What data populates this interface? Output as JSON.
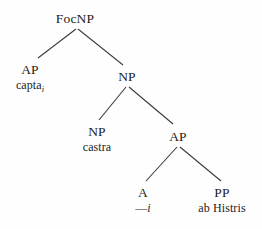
{
  "figure": {
    "type": "syntax-tree",
    "background_color": "#fefefe",
    "line_color": "#3a3a3a",
    "text_color": "#1c1c1c"
  },
  "nodes": [
    {
      "id": "root",
      "label": "FocNP",
      "gloss": "",
      "gloss_suffix": "",
      "x": 75,
      "y": 12
    },
    {
      "id": "ap-top",
      "label": "AP",
      "gloss": "capta",
      "gloss_suffix": "i",
      "x": 30,
      "y": 63
    },
    {
      "id": "np-mid",
      "label": "NP",
      "gloss": "",
      "gloss_suffix": "",
      "x": 127,
      "y": 70
    },
    {
      "id": "np-low",
      "label": "NP",
      "gloss": "castra",
      "gloss_suffix": "",
      "x": 97,
      "y": 125
    },
    {
      "id": "ap-low",
      "label": "AP",
      "gloss": "",
      "gloss_suffix": "",
      "x": 178,
      "y": 130
    },
    {
      "id": "a-leaf",
      "label": "A",
      "gloss_dash": "—",
      "gloss_italic": "i",
      "x": 143,
      "y": 186
    },
    {
      "id": "pp-leaf",
      "label": "PP",
      "gloss": "ab Histris",
      "gloss_suffix": "",
      "x": 222,
      "y": 186
    }
  ],
  "edges": [
    {
      "id": "root-to-ap",
      "from": "root",
      "to": "ap-top",
      "x1": 76,
      "y1": 29,
      "x2": 38,
      "y2": 58
    },
    {
      "id": "root-to-np",
      "from": "root",
      "to": "np-mid",
      "x1": 78,
      "y1": 29,
      "x2": 123,
      "y2": 65
    },
    {
      "id": "np-to-np",
      "from": "np-mid",
      "to": "np-low",
      "x1": 126,
      "y1": 87,
      "x2": 99,
      "y2": 120
    },
    {
      "id": "np-to-ap",
      "from": "np-mid",
      "to": "ap-low",
      "x1": 129,
      "y1": 87,
      "x2": 173,
      "y2": 124
    },
    {
      "id": "ap-to-a",
      "from": "ap-low",
      "to": "a-leaf",
      "x1": 177,
      "y1": 147,
      "x2": 146,
      "y2": 181
    },
    {
      "id": "ap-to-pp",
      "from": "ap-low",
      "to": "pp-leaf",
      "x1": 180,
      "y1": 147,
      "x2": 221,
      "y2": 181
    }
  ]
}
